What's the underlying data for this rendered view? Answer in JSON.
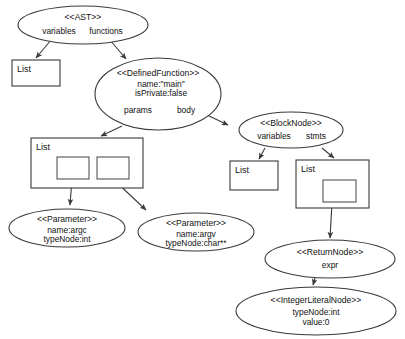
{
  "diagram": {
    "type": "object-diagram",
    "background_color": "#ffffff",
    "stroke_color": "#3a3a3a",
    "text_color": "#111111"
  },
  "nodes": {
    "ast": {
      "title": "<<AST>>",
      "slot_variables": "variables",
      "slot_functions": "functions"
    },
    "list_variables": {
      "label": "List"
    },
    "defined_function": {
      "title": "<<DefinedFunction>>",
      "attr_name": "name:\"main\"",
      "attr_private": "isPrivate:false",
      "slot_params": "params",
      "slot_body": "body"
    },
    "list_params": {
      "label": "List"
    },
    "block_node": {
      "title": "<<BlockNode>>",
      "slot_variables": "variables",
      "slot_stmts": "stmts"
    },
    "list_block_variables": {
      "label": "List"
    },
    "list_stmts": {
      "label": "List"
    },
    "parameter_argc": {
      "title": "<<Parameter>>",
      "attr_name": "name:argc",
      "attr_type": "typeNode:int"
    },
    "parameter_argv": {
      "title": "<<Parameter>>",
      "attr_name": "name:argv",
      "attr_type": "typeNode:char**"
    },
    "return_node": {
      "title": "<<ReturnNode>>",
      "slot_expr": "expr"
    },
    "integer_literal_node": {
      "title": "<<IntegerLiteralNode>>",
      "attr_type": "typeNode:int",
      "attr_value": "value:0"
    }
  }
}
